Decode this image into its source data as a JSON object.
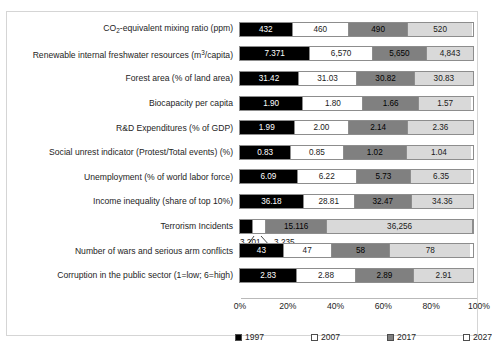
{
  "chart_data": {
    "type": "bar",
    "subtype": "100% stacked horizontal bar",
    "title": "",
    "xlabel": "",
    "ylabel": "",
    "xlim": [
      0,
      100
    ],
    "xticks": [
      "0%",
      "20%",
      "40%",
      "60%",
      "80%",
      "100%"
    ],
    "grid": false,
    "legend_position": "bottom",
    "series": [
      {
        "name": "1997",
        "color": "#000000"
      },
      {
        "name": "2007",
        "color": "#ffffff"
      },
      {
        "name": "2017",
        "color": "#808080"
      },
      {
        "name": "2027",
        "color": "#d9d9d9"
      }
    ],
    "categories": [
      "CO2-equivalent mixing ratio (ppm)",
      "Renewable internal freshwater resources (m3/capita)",
      "Forest area (% of land area)",
      "Biocapacity per capita",
      "R&D Expenditures (% of GDP)",
      "Social unrest indicator (Protest/Total events) (%)",
      "Unemployment  (% of world labor force)",
      "Income inequality (share of top 10%)",
      "Terrorism Incidents",
      "Number of wars and serious arm conflicts",
      "Corruption in the public sector (1=low; 6=high)"
    ],
    "rows": [
      {
        "label_html": "CO<sub>2</sub>-equivalent mixing ratio (ppm)",
        "values": [
          432,
          460,
          490,
          520
        ],
        "value_labels": [
          "432",
          "460",
          "490",
          "520"
        ],
        "percents": [
          22.6,
          24.1,
          25.6,
          27.2
        ]
      },
      {
        "label_html": "Renewable internal freshwater resources (m<sup>3</sup>/capita)",
        "values": [
          7371,
          6570,
          5650,
          4843
        ],
        "value_labels": [
          "7.371",
          "6,570",
          "5,650",
          "4,843"
        ],
        "percents": [
          30.2,
          26.9,
          23.2,
          19.8
        ]
      },
      {
        "label_html": "Forest area (% of land area)",
        "values": [
          31.42,
          31.03,
          30.82,
          30.83
        ],
        "value_labels": [
          "31.42",
          "31.03",
          "30.82",
          "30.83"
        ],
        "percents": [
          25.3,
          25.0,
          24.8,
          24.8
        ]
      },
      {
        "label_html": "Biocapacity per capita",
        "values": [
          1.9,
          1.8,
          1.66,
          1.57
        ],
        "value_labels": [
          "1.90",
          "1.80",
          "1.66",
          "1.57"
        ],
        "percents": [
          27.2,
          25.8,
          23.8,
          22.5
        ]
      },
      {
        "label_html": "R&amp;D Expenditures (% of GDP)",
        "values": [
          1.99,
          2.0,
          2.14,
          2.36
        ],
        "value_labels": [
          "1.99",
          "2.00",
          "2.14",
          "2.36"
        ],
        "percents": [
          23.4,
          23.5,
          25.2,
          27.8
        ]
      },
      {
        "label_html": "Social unrest indicator (Protest/Total events) (%)",
        "values": [
          0.83,
          0.85,
          1.02,
          1.04
        ],
        "value_labels": [
          "0.83",
          "0.85",
          "1.02",
          "1.04"
        ],
        "percents": [
          22.0,
          22.5,
          27.1,
          27.6
        ]
      },
      {
        "label_html": "Unemployment  (% of world labor force)",
        "values": [
          6.09,
          6.22,
          5.73,
          6.35
        ],
        "value_labels": [
          "6.09",
          "6.22",
          "5.73",
          "6.35"
        ],
        "percents": [
          24.8,
          25.3,
          23.3,
          25.8
        ]
      },
      {
        "label_html": "Income inequality (share of top 10%)",
        "values": [
          36.18,
          28.81,
          32.47,
          34.36
        ],
        "value_labels": [
          "36.18",
          "28.81",
          "32.47",
          "34.36"
        ],
        "percents": [
          27.4,
          21.8,
          24.6,
          26.1
        ]
      },
      {
        "label_html": "Terrorism Incidents",
        "values": [
          3201,
          3235,
          15116,
          36256
        ],
        "value_labels": [
          "3,201",
          "3,235",
          "15.116",
          "36,256"
        ],
        "percents": [
          5.6,
          5.6,
          26.3,
          62.6
        ],
        "callouts": [
          {
            "text": "3,201",
            "left_pct": 0.0
          },
          {
            "text": "3,235",
            "left_pct": 14.5
          }
        ]
      },
      {
        "label_html": "Number of wars and serious arm conflicts",
        "values": [
          43,
          47,
          58,
          78
        ],
        "value_labels": [
          "43",
          "47",
          "58",
          "78"
        ],
        "percents": [
          18.8,
          20.5,
          25.3,
          34.1
        ]
      },
      {
        "label_html": "Corruption in the public sector (1=low; 6=high)",
        "values": [
          2.83,
          2.88,
          2.89,
          2.91
        ],
        "value_labels": [
          "2.83",
          "2.88",
          "2.89",
          "2.91"
        ],
        "percents": [
          24.6,
          25.1,
          25.1,
          25.3
        ]
      }
    ]
  },
  "axis": {
    "ticks": [
      {
        "label": "0%",
        "pos_pct": 0
      },
      {
        "label": "20%",
        "pos_pct": 20
      },
      {
        "label": "40%",
        "pos_pct": 40
      },
      {
        "label": "60%",
        "pos_pct": 60
      },
      {
        "label": "80%",
        "pos_pct": 80
      },
      {
        "label": "100%",
        "pos_pct": 100
      }
    ]
  },
  "legend": {
    "items": [
      {
        "label": "1997",
        "swatch": "sw1997",
        "left": 0
      },
      {
        "label": "2007",
        "swatch": "sw2007",
        "left": 76
      },
      {
        "label": "2017",
        "swatch": "sw2017",
        "left": 152
      },
      {
        "label": "2027",
        "swatch": "sw2027",
        "left": 228
      }
    ]
  }
}
